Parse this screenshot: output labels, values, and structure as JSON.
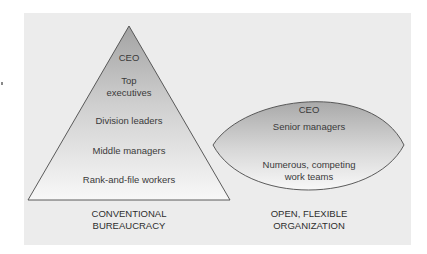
{
  "diagram": {
    "left": {
      "shape": "triangle",
      "levels": [
        "CEO",
        "Top\nexecutives",
        "Division leaders",
        "Middle managers",
        "Rank-and-file workers"
      ],
      "caption": "CONVENTIONAL\nBUREAUCRACY"
    },
    "right": {
      "shape": "lens",
      "levels": [
        "CEO",
        "Senior managers",
        "Numerous, competing\nwork teams"
      ],
      "caption": "OPEN, FLEXIBLE\nORGANIZATION"
    },
    "colors": {
      "panel": "#ececec",
      "shape_top": "#a9a9a9",
      "shape_bottom": "#f7f7f7",
      "outline": "#4a4a4a"
    }
  }
}
